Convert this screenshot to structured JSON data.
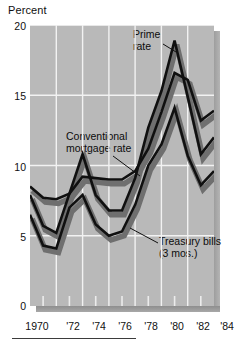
{
  "chart_data": {
    "type": "line",
    "title": "",
    "subtitle": "",
    "ylabel": "Percent",
    "xlabel": "",
    "ylim": [
      0,
      20
    ],
    "xlim": [
      1970,
      1984
    ],
    "yticks": [
      0,
      5,
      10,
      15,
      20
    ],
    "ytick_labels": [
      "0",
      "5",
      "10",
      "15",
      "20"
    ],
    "xticks": [
      1970,
      1972,
      1974,
      1976,
      1978,
      1980,
      1982,
      1984
    ],
    "xtick_labels": [
      "1970",
      "'72",
      "'74",
      "'76",
      "'78",
      "'80",
      "'82",
      "'84"
    ],
    "grid": true,
    "grid_color": "#f2f2f2",
    "plot_background": "#b9b9b9",
    "line_color": "#101010",
    "shadow_color": "#6f6f6f",
    "legend_position": "inline-annotations",
    "x": [
      1970,
      1971,
      1972,
      1973,
      1974,
      1975,
      1976,
      1977,
      1978,
      1979,
      1980,
      1981,
      1982,
      1983,
      1984
    ],
    "series": [
      {
        "name": "Prime rate",
        "values": [
          7.9,
          5.7,
          5.2,
          8.0,
          10.8,
          7.9,
          6.8,
          6.8,
          9.1,
          12.7,
          15.3,
          18.9,
          14.9,
          10.8,
          12.0
        ]
      },
      {
        "name": "Conventional mortgage rate",
        "values": [
          8.5,
          7.7,
          7.6,
          8.0,
          9.2,
          9.1,
          9.0,
          9.0,
          9.6,
          11.2,
          13.8,
          16.6,
          16.1,
          13.2,
          13.9
        ]
      },
      {
        "name": "Treasury bills (3 mos.)",
        "values": [
          6.5,
          4.3,
          4.1,
          7.0,
          7.9,
          5.8,
          5.0,
          5.3,
          7.2,
          10.0,
          11.5,
          14.1,
          10.7,
          8.6,
          9.6
        ]
      }
    ],
    "annotations": [
      {
        "id": "prime-rate",
        "text": "Prime\nrate",
        "line1": "Prime",
        "line2": "rate"
      },
      {
        "id": "conventional-mortgage-rate",
        "text": "Conventional\nmortgage rate",
        "line1": "Conventional",
        "line2": "mortgage rate"
      },
      {
        "id": "treasury-bills",
        "text": "Treasury bills\n(3 mos.)",
        "line1": "Treasury bills",
        "line2": "(3 mos.)"
      }
    ]
  },
  "axis": {
    "y_axis_title": "Percent",
    "y_labels": [
      "20",
      "15",
      "10",
      "5",
      "0"
    ],
    "x_labels": [
      "1970",
      "'72",
      "'74",
      "'76",
      "'78",
      "'80",
      "'82",
      "'84"
    ]
  },
  "annotations": {
    "prime_line1": "Prime",
    "prime_line2": "rate",
    "mortgage_line1": "Conventional",
    "mortgage_line2": "mortgage rate",
    "tbill_line1": "Treasury bills",
    "tbill_line2": "(3 mos.)"
  }
}
